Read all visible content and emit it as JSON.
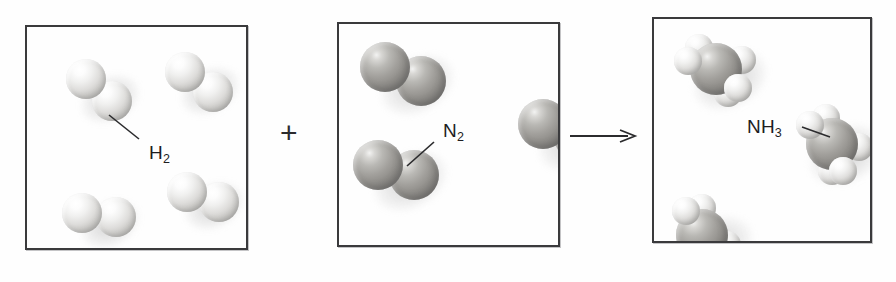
{
  "diagram": {
    "kind": "chemical-reaction-particle-diagram",
    "equation_text": "H2 + N2 -> NH3",
    "plus_symbol": "+",
    "arrow_symbol": "→",
    "background_color": "#fefefe",
    "border_color": "#3a3a3c"
  },
  "boxes": [
    {
      "id": "reactant-hydrogen",
      "label": "H",
      "label_sub": "2",
      "x": 25,
      "y": 25,
      "width": 223,
      "height": 225,
      "label_x": 122,
      "label_y": 115,
      "leader": {
        "x1": 112,
        "y1": 112,
        "x2": 82,
        "y2": 88
      },
      "molecules": [
        {
          "type": "H2",
          "cx": 72,
          "cy": 63,
          "angle": 42
        },
        {
          "type": "H2",
          "cx": 172,
          "cy": 55,
          "angle": 36
        },
        {
          "type": "H2",
          "cx": 72,
          "cy": 188,
          "angle": 8
        },
        {
          "type": "H2",
          "cx": 176,
          "cy": 170,
          "angle": 18
        }
      ]
    },
    {
      "id": "reactant-nitrogen",
      "label": "N",
      "label_sub": "2",
      "x": 337,
      "y": 22,
      "width": 223,
      "height": 225,
      "label_x": 104,
      "label_y": 96,
      "leader": {
        "x1": 95,
        "y1": 118,
        "x2": 68,
        "y2": 142
      },
      "molecules": [
        {
          "type": "N2",
          "cx": 64,
          "cy": 50,
          "angle": 22
        },
        {
          "type": "N2",
          "cx": 57,
          "cy": 146,
          "angle": 14
        },
        {
          "type": "N2",
          "cx": 222,
          "cy": 106,
          "angle": 18
        }
      ]
    },
    {
      "id": "product-ammonia",
      "label": "NH",
      "label_sub": "3",
      "x": 652,
      "y": 17,
      "width": 220,
      "height": 226,
      "label_x": 93,
      "label_y": 97,
      "leader": {
        "x1": 148,
        "y1": 108,
        "x2": 176,
        "y2": 118
      },
      "molecules": [
        {
          "type": "NH3",
          "cx": 62,
          "cy": 50,
          "angle": -14
        },
        {
          "type": "NH3",
          "cx": 178,
          "cy": 125,
          "angle": 12
        },
        {
          "type": "NH3",
          "cx": 48,
          "cy": 216,
          "angle": 26
        }
      ]
    }
  ],
  "operators": [
    {
      "id": "plus",
      "symbol": "+",
      "x": 280,
      "y": 118
    },
    {
      "id": "arrow",
      "x": 570,
      "y": 127,
      "length": 64
    }
  ],
  "molecule_geometry": {
    "H2": {
      "radius": 20,
      "bond_offset": 17,
      "atoms": [
        "h",
        "h"
      ]
    },
    "N2": {
      "radius": 25,
      "bond_offset": 19,
      "atoms": [
        "n",
        "n"
      ]
    },
    "NH3": {
      "n_radius": 26,
      "h_radius": 14,
      "h_distance": 27
    }
  },
  "colors": {
    "hydrogen_atom": "#e8e7e5",
    "nitrogen_atom": "#9a9895",
    "label_text": "#1d1d1f",
    "line": "#2b2b2d"
  }
}
